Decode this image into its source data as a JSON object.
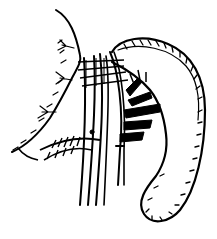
{
  "illustration": {
    "subject": "anatomical line drawing of an organ with surgical clamps",
    "colors": {
      "background": "#ffffff",
      "ink": "#000000"
    }
  }
}
